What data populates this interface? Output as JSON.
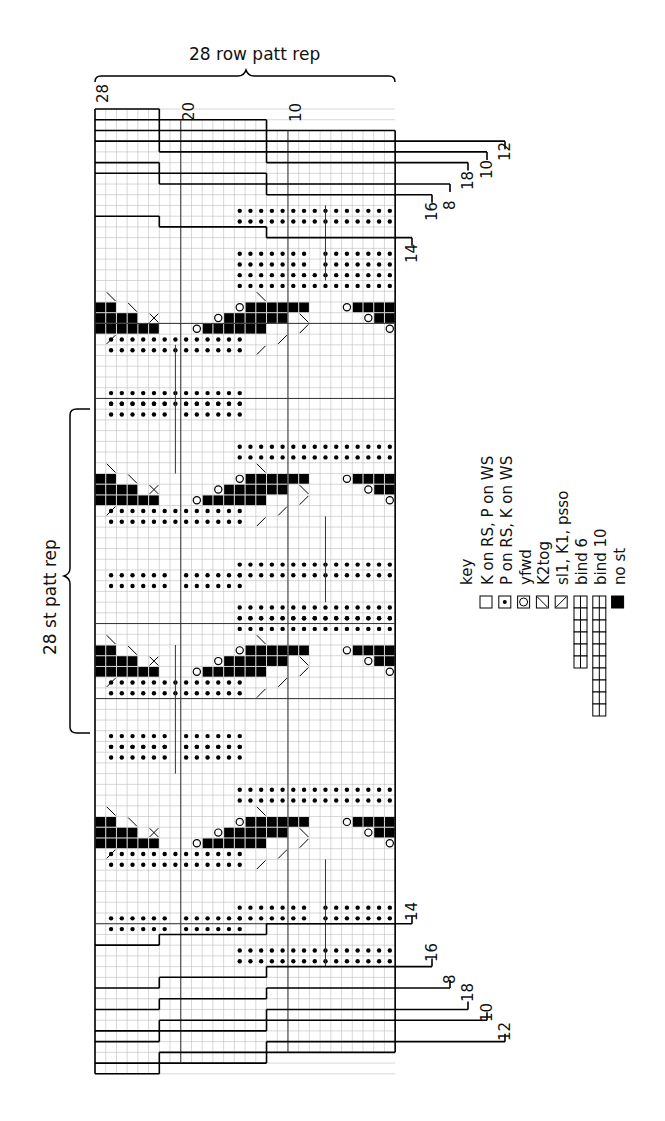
{
  "title_top": "28 row patt rep",
  "title_side": "28 st patt rep",
  "row_numbers_top": [
    {
      "label": "28",
      "col": 0
    },
    {
      "label": "20",
      "col": 8
    },
    {
      "label": "10",
      "col": 18
    }
  ],
  "bindoff_labels_top": [
    {
      "label": "12",
      "y": 137,
      "x": 505
    },
    {
      "label": "10",
      "y": 155,
      "x": 487
    },
    {
      "label": "18",
      "y": 166,
      "x": 468
    },
    {
      "label": "8",
      "y": 186,
      "x": 450
    },
    {
      "label": "16",
      "y": 197,
      "x": 432
    },
    {
      "label": "14",
      "y": 239,
      "x": 412
    }
  ],
  "bindoff_labels_bottom": [
    {
      "label": "14",
      "y": 917,
      "x": 412
    },
    {
      "label": "16",
      "y": 958,
      "x": 432
    },
    {
      "label": "8",
      "y": 980,
      "x": 450
    },
    {
      "label": "18",
      "y": 998,
      "x": 468
    },
    {
      "label": "10",
      "y": 1018,
      "x": 487
    },
    {
      "label": "12",
      "y": 1037,
      "x": 505
    }
  ],
  "key": {
    "title": "key",
    "items": [
      {
        "symbol": "knit",
        "label": "K on RS, P on WS"
      },
      {
        "symbol": "purl",
        "label": "P on RS, K on WS"
      },
      {
        "symbol": "yfwd",
        "label": "yfwd"
      },
      {
        "symbol": "k2tog",
        "label": "K2tog"
      },
      {
        "symbol": "skpo",
        "label": "sl1, K1, psso"
      },
      {
        "symbol": "bind6",
        "label": "bind 6"
      },
      {
        "symbol": "bind10",
        "label": "bind 10"
      },
      {
        "symbol": "nost",
        "label": "no st"
      }
    ]
  },
  "grid": {
    "x0": 95,
    "y0": 109,
    "cell": 10.72,
    "cols": 28,
    "rows": 90
  },
  "colors": {
    "grid": "#bdbdbd",
    "line": "#111111",
    "fill": "#000000"
  }
}
